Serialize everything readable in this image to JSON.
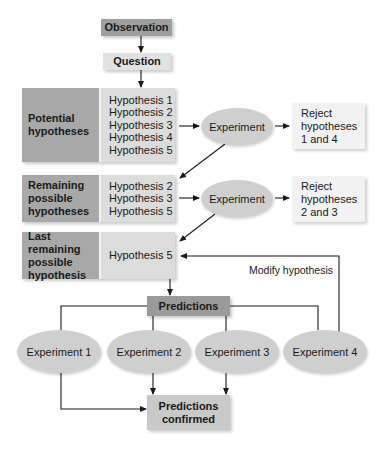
{
  "observation": "Observation",
  "question": "Question",
  "potential": {
    "label": "Potential hypotheses",
    "hypotheses": [
      "Hypothesis 1",
      "Hypothesis 2",
      "Hypothesis 3",
      "Hypothesis 4",
      "Hypothesis 5"
    ]
  },
  "experiment_a": "Experiment",
  "reject_a": [
    "Reject",
    "hypotheses",
    "1 and 4"
  ],
  "remaining": {
    "label": "Remaining possible hypotheses",
    "hypotheses": [
      "Hypothesis 2",
      "Hypothesis 3",
      "Hypothesis 5"
    ]
  },
  "experiment_b": "Experiment",
  "reject_b": [
    "Reject",
    "hypotheses",
    "2 and 3"
  ],
  "last": {
    "label": "Last remaining possible hypothesis",
    "hypotheses": [
      "Hypothesis 5"
    ]
  },
  "modify_label": "Modify hypothesis",
  "predictions": "Predictions",
  "experiments": [
    "Experiment 1",
    "Experiment 2",
    "Experiment 3",
    "Experiment 4"
  ],
  "confirmed": "Predictions confirmed",
  "colors": {
    "dark_cell": "#a8a8a8",
    "light_cell": "#dcdcdc",
    "ellipse": "#cfcfcf",
    "observation": "#9e9e9e",
    "line": "#1a1a1a"
  }
}
